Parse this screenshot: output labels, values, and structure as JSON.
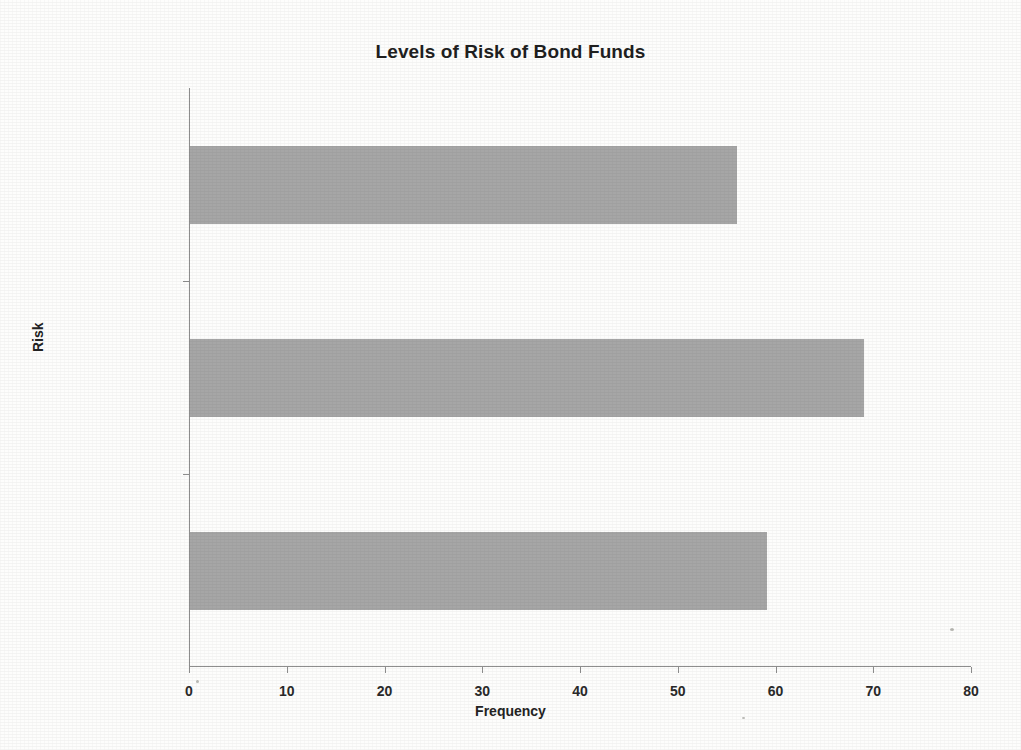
{
  "chart_data": {
    "type": "bar",
    "orientation": "horizontal",
    "title": "Levels of Risk of Bond Funds",
    "xlabel": "Frequency",
    "ylabel": "Risk",
    "categories": [
      "Below average",
      "Average",
      "Above average"
    ],
    "values": [
      56,
      69,
      59
    ],
    "xlim": [
      0,
      80
    ],
    "xticks": [
      0,
      10,
      20,
      30,
      40,
      50,
      60,
      70,
      80
    ],
    "xtick_labels": [
      "0",
      "10",
      "20",
      "30",
      "40",
      "50",
      "60",
      "70",
      "80"
    ],
    "grid": false,
    "legend": false,
    "bar_color": "#a6a6a6",
    "axis_color": "#8e8e8e",
    "background_color": "#fdfdfc",
    "series": [
      {
        "name": "Frequency",
        "values": [
          56,
          69,
          59
        ]
      }
    ]
  }
}
